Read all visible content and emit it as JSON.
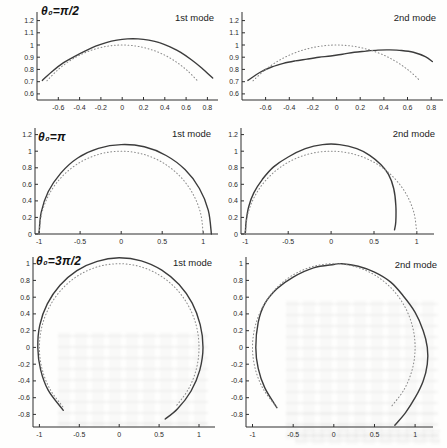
{
  "figure": {
    "curve_color": "#3c3c3c",
    "dotted_color": "#8c8c8c",
    "axis_color": "#2e2e2e",
    "tick_text_color": "#2a2a2a"
  },
  "chart_data": [
    {
      "type": "line",
      "title": "θ₀=π/2",
      "mode_label": "1st mode",
      "xlim": [
        -0.8,
        0.9
      ],
      "ylim": [
        0.55,
        1.27
      ],
      "grid": false,
      "xticks": [
        -0.6,
        -0.4,
        -0.2,
        0,
        0.2,
        0.4,
        0.6,
        0.8
      ],
      "xtick_labels": [
        "-0.6",
        "-0.4",
        "-0.2",
        "0",
        "0.2",
        "0.4",
        "0.6",
        "0.8"
      ],
      "yticks": [
        0.6,
        0.7,
        0.8,
        0.9,
        1,
        1.1,
        1.2
      ],
      "ytick_labels": [
        "0.6",
        "0.7",
        "0.8",
        "0.9",
        "1",
        "1.1",
        "1.2"
      ],
      "series": [
        {
          "name": "mode-shape",
          "style": "solid",
          "points": [
            [
              -0.75,
              0.71
            ],
            [
              -0.65,
              0.79
            ],
            [
              -0.55,
              0.855
            ],
            [
              -0.45,
              0.905
            ],
            [
              -0.35,
              0.95
            ],
            [
              -0.25,
              0.99
            ],
            [
              -0.15,
              1.02
            ],
            [
              -0.05,
              1.04
            ],
            [
              0.05,
              1.05
            ],
            [
              0.15,
              1.05
            ],
            [
              0.25,
              1.04
            ],
            [
              0.35,
              1.02
            ],
            [
              0.45,
              0.985
            ],
            [
              0.55,
              0.94
            ],
            [
              0.65,
              0.88
            ],
            [
              0.75,
              0.81
            ],
            [
              0.85,
              0.73
            ]
          ]
        },
        {
          "name": "undeformed-arch",
          "style": "dotted",
          "points": [
            [
              -0.707,
              0.707
            ],
            [
              -0.609,
              0.793
            ],
            [
              -0.5,
              0.866
            ],
            [
              -0.383,
              0.924
            ],
            [
              -0.259,
              0.966
            ],
            [
              -0.131,
              0.991
            ],
            [
              0,
              1
            ],
            [
              0.131,
              0.991
            ],
            [
              0.259,
              0.966
            ],
            [
              0.383,
              0.924
            ],
            [
              0.5,
              0.866
            ],
            [
              0.609,
              0.793
            ],
            [
              0.707,
              0.707
            ]
          ]
        }
      ]
    },
    {
      "type": "line",
      "mode_label": "2nd mode",
      "xlim": [
        -0.8,
        0.9
      ],
      "ylim": [
        0.55,
        1.27
      ],
      "grid": false,
      "xticks": [
        -0.6,
        -0.4,
        -0.2,
        0,
        0.2,
        0.4,
        0.6,
        0.8
      ],
      "xtick_labels": [
        "-0.6",
        "-0.4",
        "-0.2",
        "0",
        "0.2",
        "0.4",
        "0.6",
        "0.8"
      ],
      "yticks": [
        0.6,
        0.7,
        0.8,
        0.9,
        1,
        1.1,
        1.2
      ],
      "ytick_labels": [
        "0.6",
        "0.7",
        "0.8",
        "0.9",
        "1",
        "1.1",
        "1.2"
      ],
      "series": [
        {
          "name": "mode-shape",
          "style": "solid",
          "points": [
            [
              -0.75,
              0.71
            ],
            [
              -0.65,
              0.775
            ],
            [
              -0.55,
              0.82
            ],
            [
              -0.45,
              0.85
            ],
            [
              -0.35,
              0.87
            ],
            [
              -0.25,
              0.885
            ],
            [
              -0.15,
              0.9
            ],
            [
              -0.05,
              0.91
            ],
            [
              0.05,
              0.925
            ],
            [
              0.15,
              0.94
            ],
            [
              0.25,
              0.95
            ],
            [
              0.35,
              0.958
            ],
            [
              0.45,
              0.96
            ],
            [
              0.55,
              0.955
            ],
            [
              0.65,
              0.94
            ],
            [
              0.75,
              0.905
            ],
            [
              0.81,
              0.865
            ]
          ]
        },
        {
          "name": "undeformed-arch",
          "style": "dotted",
          "points": [
            [
              -0.707,
              0.707
            ],
            [
              -0.609,
              0.793
            ],
            [
              -0.5,
              0.866
            ],
            [
              -0.383,
              0.924
            ],
            [
              -0.259,
              0.966
            ],
            [
              -0.131,
              0.991
            ],
            [
              0,
              1
            ],
            [
              0.131,
              0.991
            ],
            [
              0.259,
              0.966
            ],
            [
              0.383,
              0.924
            ],
            [
              0.5,
              0.866
            ],
            [
              0.609,
              0.793
            ],
            [
              0.707,
              0.707
            ]
          ]
        }
      ]
    },
    {
      "type": "line",
      "title": "θ₀=π",
      "mode_label": "1st mode",
      "xlim": [
        -1.05,
        1.18
      ],
      "ylim": [
        0,
        1.28
      ],
      "grid": false,
      "xticks": [
        -1,
        -0.5,
        0,
        0.5,
        1
      ],
      "xtick_labels": [
        "-1",
        "-0.5",
        "0",
        "0.5",
        "1"
      ],
      "yticks": [
        0,
        0.2,
        0.4,
        0.6,
        0.8,
        1,
        1.2
      ],
      "ytick_labels": [
        "0",
        "0.2",
        "0.4",
        "0.6",
        "0.8",
        "1",
        "1.2"
      ],
      "series": [
        {
          "name": "mode-shape",
          "style": "solid",
          "points": [
            [
              -1,
              0
            ],
            [
              -0.975,
              0.261
            ],
            [
              -0.888,
              0.513
            ],
            [
              -0.735,
              0.735
            ],
            [
              -0.53,
              0.918
            ],
            [
              -0.277,
              1.034
            ],
            [
              0,
              1.08
            ],
            [
              0.282,
              1.053
            ],
            [
              0.548,
              0.948
            ],
            [
              0.778,
              0.778
            ],
            [
              0.953,
              0.55
            ],
            [
              1.062,
              0.285
            ],
            [
              1.1,
              0
            ]
          ]
        },
        {
          "name": "undeformed-arch",
          "style": "dotted",
          "points": [
            [
              -1,
              0
            ],
            [
              -0.966,
              0.259
            ],
            [
              -0.866,
              0.5
            ],
            [
              -0.707,
              0.707
            ],
            [
              -0.5,
              0.866
            ],
            [
              -0.259,
              0.966
            ],
            [
              0,
              1
            ],
            [
              0.259,
              0.966
            ],
            [
              0.5,
              0.866
            ],
            [
              0.707,
              0.707
            ],
            [
              0.866,
              0.5
            ],
            [
              0.966,
              0.259
            ],
            [
              1,
              0
            ]
          ]
        }
      ]
    },
    {
      "type": "line",
      "mode_label": "2nd mode",
      "xlim": [
        -1.05,
        1.2
      ],
      "ylim": [
        0,
        1.28
      ],
      "grid": false,
      "xticks": [
        -1,
        -0.5,
        0,
        0.5,
        1
      ],
      "xtick_labels": [
        "-1",
        "-0.5",
        "0",
        "0.5",
        "1"
      ],
      "yticks": [
        0,
        0.2,
        0.4,
        0.6,
        0.8,
        1,
        1.2
      ],
      "ytick_labels": [
        "0",
        "0.2",
        "0.4",
        "0.6",
        "0.8",
        "1",
        "1.2"
      ],
      "series": [
        {
          "name": "mode-shape",
          "style": "solid",
          "points": [
            [
              -1,
              0
            ],
            [
              -0.99,
              0.15
            ],
            [
              -0.96,
              0.33
            ],
            [
              -0.9,
              0.5
            ],
            [
              -0.8,
              0.66
            ],
            [
              -0.67,
              0.81
            ],
            [
              -0.5,
              0.93
            ],
            [
              -0.3,
              1.03
            ],
            [
              -0.1,
              1.08
            ],
            [
              0.1,
              1.08
            ],
            [
              0.3,
              1.03
            ],
            [
              0.45,
              0.95
            ],
            [
              0.58,
              0.84
            ],
            [
              0.67,
              0.72
            ],
            [
              0.73,
              0.55
            ],
            [
              0.755,
              0.35
            ],
            [
              0.755,
              0.15
            ],
            [
              0.74,
              0.05
            ]
          ]
        },
        {
          "name": "undeformed-arch",
          "style": "dotted",
          "points": [
            [
              -1,
              0
            ],
            [
              -0.966,
              0.259
            ],
            [
              -0.866,
              0.5
            ],
            [
              -0.707,
              0.707
            ],
            [
              -0.5,
              0.866
            ],
            [
              -0.259,
              0.966
            ],
            [
              0,
              1
            ],
            [
              0.259,
              0.966
            ],
            [
              0.5,
              0.866
            ],
            [
              0.707,
              0.707
            ],
            [
              0.866,
              0.5
            ],
            [
              0.966,
              0.259
            ],
            [
              1,
              0
            ]
          ]
        }
      ]
    },
    {
      "type": "line",
      "title": "θ₀=3π/2",
      "mode_label": "1st mode",
      "xlim": [
        -1.08,
        1.2
      ],
      "ylim": [
        -0.95,
        1.08
      ],
      "grid": false,
      "xticks": [
        -1,
        -0.5,
        0,
        0.5,
        1
      ],
      "xtick_labels": [
        "-1",
        "-0.5",
        "0",
        "0.5",
        "1"
      ],
      "yticks": [
        -0.8,
        -0.6,
        -0.4,
        -0.2,
        0,
        0.2,
        0.4,
        0.6,
        0.8,
        1
      ],
      "ytick_labels": [
        "-0.8",
        "-0.6",
        "-0.4",
        "-0.2",
        "0",
        "0.2",
        "0.4",
        "0.6",
        "0.8",
        "1"
      ],
      "series": [
        {
          "name": "mode-shape",
          "style": "solid",
          "points": [
            [
              -0.7,
              -0.75
            ],
            [
              -0.888,
              -0.513
            ],
            [
              -0.985,
              -0.264
            ],
            [
              -1.02,
              0
            ],
            [
              -0.995,
              0.267
            ],
            [
              -0.901,
              0.52
            ],
            [
              -0.742,
              0.742
            ],
            [
              -0.53,
              0.918
            ],
            [
              -0.276,
              1.029
            ],
            [
              0,
              1.07
            ],
            [
              0.277,
              1.034
            ],
            [
              0.533,
              0.922
            ],
            [
              0.75,
              0.75
            ],
            [
              0.914,
              0.528
            ],
            [
              1.014,
              0.272
            ],
            [
              1.05,
              0
            ],
            [
              1.009,
              -0.27
            ],
            [
              0.9,
              -0.52
            ],
            [
              0.732,
              -0.732
            ],
            [
              0.576,
              -0.854
            ]
          ]
        },
        {
          "name": "undeformed-arch",
          "style": "dotted",
          "points": [
            [
              -0.707,
              -0.707
            ],
            [
              -0.866,
              -0.5
            ],
            [
              -0.966,
              -0.259
            ],
            [
              -1,
              0
            ],
            [
              -0.966,
              0.259
            ],
            [
              -0.866,
              0.5
            ],
            [
              -0.707,
              0.707
            ],
            [
              -0.5,
              0.866
            ],
            [
              -0.259,
              0.966
            ],
            [
              0,
              1
            ],
            [
              0.259,
              0.966
            ],
            [
              0.5,
              0.866
            ],
            [
              0.707,
              0.707
            ],
            [
              0.866,
              0.5
            ],
            [
              0.966,
              0.259
            ],
            [
              1,
              0
            ],
            [
              0.966,
              -0.259
            ],
            [
              0.866,
              -0.5
            ],
            [
              0.707,
              -0.707
            ]
          ]
        }
      ]
    },
    {
      "type": "line",
      "mode_label": "2nd mode",
      "xlim": [
        -1.08,
        1.22
      ],
      "ylim": [
        -0.95,
        1.08
      ],
      "grid": false,
      "xticks": [
        -1,
        -0.5,
        0,
        0.5,
        1
      ],
      "xtick_labels": [
        "-1",
        "-0.5",
        "0",
        "0.5",
        "1"
      ],
      "yticks": [
        -0.8,
        -0.6,
        -0.4,
        -0.2,
        0,
        0.2,
        0.4,
        0.6,
        0.8,
        1
      ],
      "ytick_labels": [
        "-0.8",
        "-0.6",
        "-0.4",
        "-0.2",
        "0",
        "0.2",
        "0.4",
        "0.6",
        "0.8",
        "1"
      ],
      "series": [
        {
          "name": "mode-shape",
          "style": "solid",
          "points": [
            [
              -0.7,
              -0.72
            ],
            [
              -0.85,
              -0.48
            ],
            [
              -0.93,
              -0.25
            ],
            [
              -0.96,
              0
            ],
            [
              -0.93,
              0.3
            ],
            [
              -0.85,
              0.52
            ],
            [
              -0.7,
              0.7
            ],
            [
              -0.5,
              0.84
            ],
            [
              -0.25,
              0.95
            ],
            [
              0,
              0.99
            ],
            [
              0.1,
              1
            ],
            [
              0.3,
              0.97
            ],
            [
              0.5,
              0.9
            ],
            [
              0.7,
              0.78
            ],
            [
              0.85,
              0.62
            ],
            [
              1,
              0.42
            ],
            [
              1.1,
              0.2
            ],
            [
              1.15,
              0
            ],
            [
              1.15,
              -0.2
            ],
            [
              1.1,
              -0.4
            ],
            [
              1,
              -0.6
            ],
            [
              0.88,
              -0.78
            ],
            [
              0.75,
              -0.93
            ]
          ]
        },
        {
          "name": "undeformed-arch",
          "style": "dotted",
          "points": [
            [
              -0.707,
              -0.707
            ],
            [
              -0.866,
              -0.5
            ],
            [
              -0.966,
              -0.259
            ],
            [
              -1,
              0
            ],
            [
              -0.966,
              0.259
            ],
            [
              -0.866,
              0.5
            ],
            [
              -0.707,
              0.707
            ],
            [
              -0.5,
              0.866
            ],
            [
              -0.259,
              0.966
            ],
            [
              0,
              1
            ],
            [
              0.259,
              0.966
            ],
            [
              0.5,
              0.866
            ],
            [
              0.707,
              0.707
            ],
            [
              0.866,
              0.5
            ],
            [
              0.966,
              0.259
            ],
            [
              1,
              0
            ],
            [
              0.966,
              -0.259
            ],
            [
              0.866,
              -0.5
            ],
            [
              0.707,
              -0.707
            ]
          ]
        }
      ]
    }
  ]
}
